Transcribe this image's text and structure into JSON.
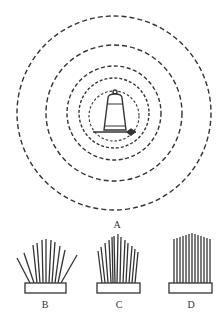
{
  "figure": {
    "panel_a": {
      "label": "A",
      "center": [
        114,
        113
      ],
      "wave_radii": [
        97,
        68,
        47,
        35,
        26
      ],
      "icon": "bell-icon"
    },
    "brushes": [
      {
        "label": "B",
        "style": "fanned",
        "bristle_count": 11
      },
      {
        "label": "C",
        "style": "partly-fanned",
        "bristle_count": 13
      },
      {
        "label": "D",
        "style": "vertical",
        "bristle_count": 13
      }
    ]
  },
  "colors": {
    "line": "#333333",
    "background": "#ffffff"
  }
}
